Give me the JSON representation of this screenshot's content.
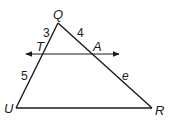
{
  "diagram": {
    "type": "geometry-triangle-with-parallel-line",
    "stroke_color": "#1a1a1a",
    "background": "#ffffff",
    "vertices": {
      "Q": {
        "label": "Q",
        "x": 58,
        "y": 23
      },
      "U": {
        "label": "U",
        "x": 16,
        "y": 108
      },
      "R": {
        "label": "R",
        "x": 152,
        "y": 108
      },
      "T": {
        "label": "T",
        "x": 40,
        "y": 54
      },
      "A": {
        "label": "A",
        "x": 95,
        "y": 54
      }
    },
    "segment_labels": {
      "QT": "3",
      "QA": "4",
      "TU": "5",
      "AR": "e"
    },
    "parallel_line": {
      "through": [
        "T",
        "A"
      ],
      "arrows": "both",
      "x_start": 25,
      "x_end": 120,
      "y": 54
    }
  }
}
